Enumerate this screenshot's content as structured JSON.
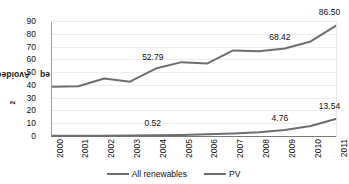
{
  "chart_data": {
    "type": "line",
    "title": "",
    "xlabel": "",
    "ylabel": "Avoided GtCO2eq",
    "ylabel_parts": {
      "prefix": "Avoided GtCO",
      "sub": "2",
      "suffix": "eq"
    },
    "categories": [
      "2000",
      "2001",
      "2002",
      "2003",
      "2004",
      "2005",
      "2006",
      "2007",
      "2008",
      "2009",
      "2010",
      "2011"
    ],
    "ylim": [
      0,
      90
    ],
    "ytick_step": 10,
    "yticks": [
      "90",
      "80",
      "70",
      "60",
      "50",
      "40",
      "30",
      "20",
      "10",
      "0"
    ],
    "grid": true,
    "grid_axis": "y",
    "legend_position": "bottom",
    "series": [
      {
        "name": "All renewables",
        "color": "#6e6e6e",
        "values": [
          38.5,
          39.0,
          45.0,
          42.5,
          52.79,
          57.8,
          56.8,
          67.0,
          66.3,
          68.42,
          74.0,
          86.5
        ],
        "labels": [
          {
            "category": "2004",
            "text": "52.79"
          },
          {
            "category": "2009",
            "text": "68.42"
          },
          {
            "category": "2011",
            "text": "86.50"
          }
        ]
      },
      {
        "name": "PV",
        "color": "#6e6e6e",
        "values": [
          0.1,
          0.15,
          0.22,
          0.32,
          0.52,
          0.85,
          1.3,
          2.0,
          3.0,
          4.76,
          7.8,
          13.54
        ],
        "labels": [
          {
            "category": "2004",
            "text": "0.52"
          },
          {
            "category": "2009",
            "text": "4.76"
          },
          {
            "category": "2011",
            "text": "13.54"
          }
        ]
      }
    ],
    "legend": [
      {
        "label": "All renewables",
        "color": "#6e6e6e"
      },
      {
        "label": "PV",
        "color": "#6e6e6e"
      }
    ]
  }
}
